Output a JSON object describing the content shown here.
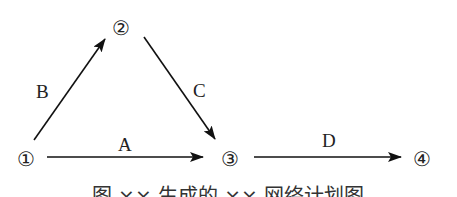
{
  "diagram": {
    "nodes": [
      {
        "id": "1",
        "label": "①"
      },
      {
        "id": "2",
        "label": "②"
      },
      {
        "id": "3",
        "label": "③"
      },
      {
        "id": "4",
        "label": "④"
      }
    ],
    "edges": [
      {
        "from": "1",
        "to": "2",
        "label": "B"
      },
      {
        "from": "2",
        "to": "3",
        "label": "C"
      },
      {
        "from": "1",
        "to": "3",
        "label": "A"
      },
      {
        "from": "3",
        "to": "4",
        "label": "D"
      }
    ],
    "caption": "图 ×× 生成的 ×× 网络计划图"
  }
}
